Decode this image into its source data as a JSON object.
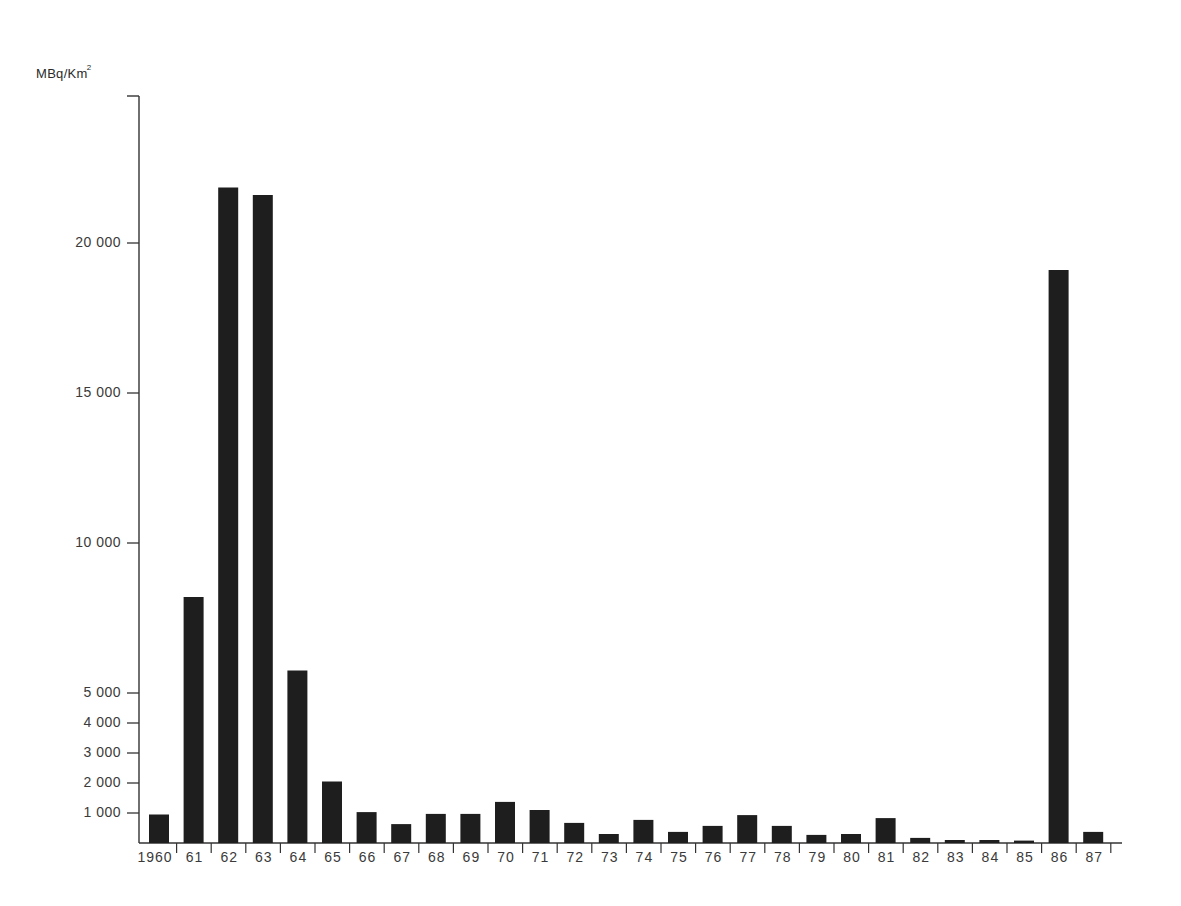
{
  "chart_data": {
    "type": "bar",
    "title": "",
    "xlabel": "",
    "ylabel": "MBq/Km²",
    "unit_main": "MBq/Km",
    "unit_sup": "2",
    "ylim": [
      0,
      25000
    ],
    "grid": false,
    "legend": null,
    "y_ticks": [
      1000,
      2000,
      3000,
      4000,
      5000,
      10000,
      15000,
      20000
    ],
    "y_tick_labels": [
      "1 000",
      "2 000",
      "3 000",
      "4 000",
      "5 000",
      "10 000",
      "15 000",
      "20 000"
    ],
    "categories": [
      "1960",
      "61",
      "62",
      "63",
      "64",
      "65",
      "66",
      "67",
      "68",
      "69",
      "70",
      "71",
      "72",
      "73",
      "74",
      "75",
      "76",
      "77",
      "78",
      "79",
      "80",
      "81",
      "82",
      "83",
      "84",
      "85",
      "86",
      "87"
    ],
    "values": [
      950,
      8200,
      21850,
      21600,
      5750,
      2050,
      1030,
      630,
      970,
      970,
      1370,
      1100,
      670,
      300,
      770,
      370,
      570,
      930,
      570,
      270,
      300,
      830,
      170,
      100,
      100,
      80,
      19100,
      370
    ],
    "bar_color": "#1e1e1e"
  },
  "layout": {
    "axis_x": 139,
    "axis_top": 96,
    "baseline_y": 843,
    "px_per_unit": 0.03,
    "first_slot_x": 142,
    "slot_width": 34.6,
    "bar_width": 20,
    "bar_offset": 7,
    "axis_end_x": 1122
  }
}
